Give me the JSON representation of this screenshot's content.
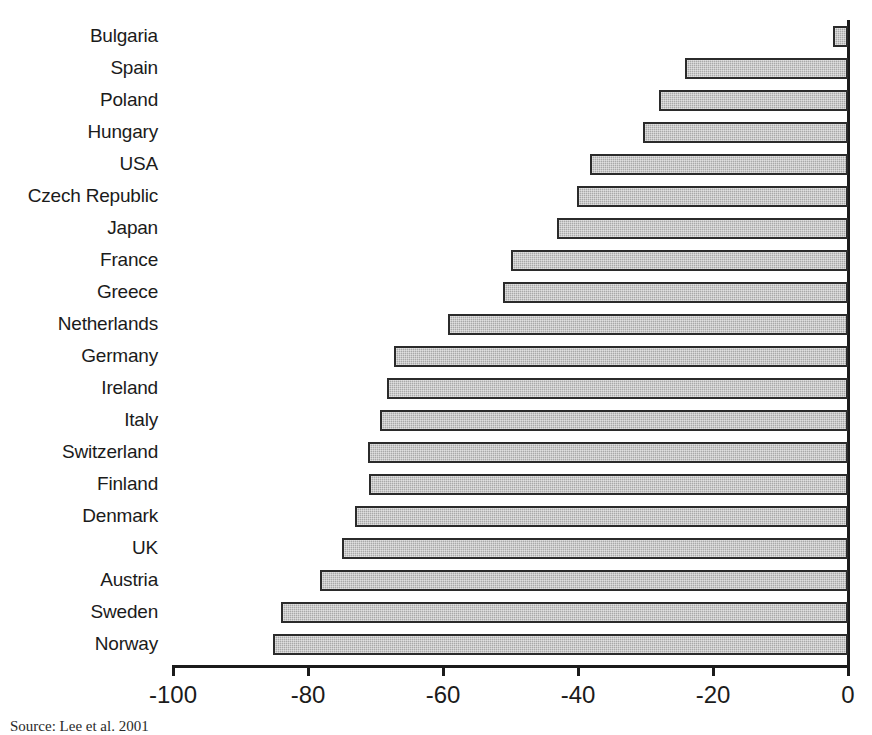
{
  "chart_data": {
    "type": "bar",
    "orientation": "horizontal",
    "title": "",
    "xlabel": "",
    "ylabel": "",
    "xlim": [
      -100,
      0
    ],
    "grid": false,
    "legend": null,
    "xticks": [
      -100,
      -80,
      -60,
      -40,
      -20,
      0
    ],
    "xtick_labels": [
      "-100",
      "-80",
      "-60",
      "-40",
      "-20",
      "0"
    ],
    "categories": [
      "Bulgaria",
      "Spain",
      "Poland",
      "Hungary",
      "USA",
      "Czech Republic",
      "Japan",
      "France",
      "Greece",
      "Netherlands",
      "Germany",
      "Ireland",
      "Italy",
      "Switzerland",
      "Finland",
      "Denmark",
      "UK",
      "Austria",
      "Sweden",
      "Norway"
    ],
    "values": [
      -2.2,
      -24.1,
      -28.0,
      -30.4,
      -38.2,
      -40.2,
      -43.1,
      -49.9,
      -51.1,
      -59.3,
      -67.3,
      -68.3,
      -69.3,
      -71.1,
      -71.0,
      -73.0,
      -75.0,
      -78.2,
      -84.0,
      -85.2
    ],
    "bar_fill_color": "#a9a9a9",
    "bar_edge_color": "#2b2b2b",
    "axis_color": "#1b1b1b"
  },
  "source_note": "Source: Lee et al. 2001"
}
